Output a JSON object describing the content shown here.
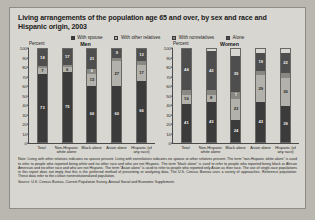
{
  "title": "Living arrangements of the population age 65 and over, by sex and race and Hispanic origin, 2003",
  "legend": [
    {
      "label": "With spouse",
      "color": "#3b3b3b"
    },
    {
      "label": "With other relatives",
      "color": "#b3b1ab"
    },
    {
      "label": "With nonrelatives",
      "color": "#8a8882"
    },
    {
      "label": "Alone",
      "color": "#4e4e4e"
    }
  ],
  "axis": {
    "percent_label": "Percent",
    "yticks": [
      100,
      90,
      80,
      70,
      60,
      50,
      40,
      30,
      20,
      10,
      0
    ],
    "ylim": [
      0,
      100
    ]
  },
  "panels": [
    {
      "title": "Men"
    },
    {
      "title": "Women"
    }
  ],
  "note": "Note: Living with other relatives indicates no spouse present. Living with nonrelatives indicates no spouse or other relatives present. The term “non-Hispanic white alone” is used to refer to people who reported being white and no other race and who are not Hispanic. The term “black alone” is used to refer to people who reported being black or African American and no other race and who are not Hispanic. The term “Asian alone” is used to refer to people who reported only Asian as their race. The use of single-race populations in this report does not imply that this is the preferred method of presenting or analyzing data. The U.S. Census Bureau uses a variety of approaches.",
  "reference": "Reference population: These data refer to the civilian noninstitutionalized population.",
  "source": "Source: U.S. Census Bureau, Current Population Survey, Annual Social and Economic Supplement.",
  "chart_data": {
    "type": "bar",
    "subtype": "stacked-100",
    "title": "Living arrangements of the population age 65 and over, by sex and race and Hispanic origin, 2003",
    "xlabel": "",
    "ylabel": "Percent",
    "ylim": [
      0,
      100
    ],
    "grid": false,
    "legend_position": "top-center",
    "categories": [
      "Total",
      "Non-Hispanic white alone",
      "Black alone",
      "Asian alone",
      "Hispanic (of any race)"
    ],
    "panels": [
      {
        "name": "Men",
        "series": [
          {
            "name": "With spouse",
            "values": [
              73,
              75,
              60,
              60,
              66
            ]
          },
          {
            "name": "With other relatives",
            "values": [
              7,
              6,
              13,
              27,
              17
            ]
          },
          {
            "name": "With nonrelatives",
            "values": [
              2,
              2,
              6,
              4,
              4
            ]
          },
          {
            "name": "Alone",
            "values": [
              18,
              17,
              21,
              9,
              13
            ]
          }
        ]
      },
      {
        "name": "Women",
        "series": [
          {
            "name": "With spouse",
            "values": [
              41,
              43,
              24,
              43,
              39
            ]
          },
          {
            "name": "With other relatives",
            "values": [
              10,
              8,
              23,
              29,
              30
            ]
          },
          {
            "name": "With nonrelatives",
            "values": [
              5,
              5,
              7,
              5,
              5
            ]
          },
          {
            "name": "Alone",
            "values": [
              44,
              42,
              39,
              19,
              22
            ]
          }
        ]
      }
    ]
  }
}
